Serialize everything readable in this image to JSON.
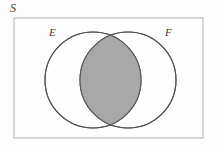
{
  "figure": {
    "kind": "venn-diagram",
    "background_color": "#fdfdfd"
  },
  "universal_set": {
    "label": "S",
    "border_color": "#b0b0b0",
    "fill_color": "#fdfdfd",
    "rect": {
      "x": 14,
      "y": 18,
      "width": 189,
      "height": 120
    }
  },
  "sets": [
    {
      "label": "E",
      "center": {
        "x": 93,
        "y": 80
      },
      "radius": 48,
      "stroke_color": "#555555",
      "fill_color": "#fdfdfd"
    },
    {
      "label": "F",
      "center": {
        "x": 128,
        "y": 80
      },
      "radius": 48,
      "stroke_color": "#555555",
      "fill_color": "#fdfdfd"
    }
  ],
  "intersection": {
    "label": "",
    "shaded": true,
    "fill_color": "#a8a8a8",
    "stroke_color": "#555555"
  }
}
